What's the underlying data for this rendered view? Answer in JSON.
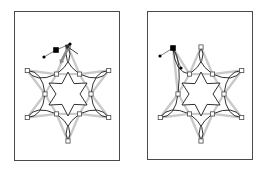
{
  "figure": {
    "type": "vector-editor-illustration",
    "background_color": "#ffffff",
    "panel_border_color": "#4a4a4a",
    "outline_color": "#1a1a1a",
    "skeleton_color": "#c9c9c9",
    "node_fill_color": "#ffffff",
    "node_stroke_color": "#4a4a4a",
    "selected_node_color": "#000000",
    "cursor_color": "#8a8a8a",
    "panels": [
      {
        "id": "before",
        "name": "left-panel",
        "geometry": {
          "x": 14,
          "y": 11,
          "width": 106,
          "height": 150
        },
        "shape": {
          "name": "six-petal-flower",
          "center": {
            "x": 53,
            "y": 82
          },
          "petal_count": 6,
          "inner_star_points": 6,
          "inner_star_outer_radius": 22,
          "inner_star_inner_radius": 12,
          "petal_inner_radius": 23,
          "petal_outer_radius": 47,
          "petal_half_width": 13,
          "rotation_deg": 90
        },
        "nodes": [
          {
            "name": "petal-tip-node",
            "angle_deg": 90,
            "radius": 47,
            "type": "square",
            "state": "normal"
          },
          {
            "name": "petal-tip-node",
            "angle_deg": 150,
            "radius": 47,
            "type": "square",
            "state": "normal"
          },
          {
            "name": "petal-tip-node",
            "angle_deg": 210,
            "radius": 47,
            "type": "square",
            "state": "normal"
          },
          {
            "name": "petal-tip-node",
            "angle_deg": 270,
            "radius": 47,
            "type": "square",
            "state": "normal"
          },
          {
            "name": "petal-tip-node",
            "angle_deg": 330,
            "radius": 47,
            "type": "square",
            "state": "normal"
          },
          {
            "name": "petal-tip-node",
            "angle_deg": 30,
            "radius": 47,
            "type": "square",
            "state": "normal"
          },
          {
            "name": "petal-base-node",
            "angle_deg": 60,
            "radius": 23,
            "type": "square",
            "state": "normal"
          },
          {
            "name": "petal-base-node",
            "angle_deg": 120,
            "radius": 23,
            "type": "square",
            "state": "normal"
          },
          {
            "name": "petal-base-node",
            "angle_deg": 180,
            "radius": 23,
            "type": "square",
            "state": "normal"
          },
          {
            "name": "petal-base-node",
            "angle_deg": 240,
            "radius": 23,
            "type": "square",
            "state": "normal"
          },
          {
            "name": "petal-base-node",
            "angle_deg": 300,
            "radius": 23,
            "type": "square",
            "state": "normal"
          },
          {
            "name": "petal-base-node",
            "angle_deg": 0,
            "radius": 23,
            "type": "square",
            "state": "normal"
          }
        ],
        "selection": {
          "selected_handle": {
            "name": "selected-control-point",
            "x": 41,
            "y": 38,
            "type": "filled-square"
          },
          "dots": [
            {
              "name": "control-dot",
              "x": 29,
              "y": 45
            },
            {
              "name": "control-dot",
              "x": 55,
              "y": 32
            }
          ],
          "drag_arrows": [
            {
              "name": "drag-arrow-down",
              "from": {
                "x": 55,
                "y": 32
              },
              "to": {
                "x": 45,
                "y": 52
              }
            },
            {
              "name": "drag-arrow-diagonal",
              "from": {
                "x": 63,
                "y": 42
              },
              "to": {
                "x": 50,
                "y": 33
              }
            }
          ]
        }
      },
      {
        "id": "after",
        "name": "right-panel",
        "geometry": {
          "x": 147,
          "y": 11,
          "width": 106,
          "height": 149
        },
        "shape": {
          "name": "six-petal-flower-edited",
          "center": {
            "x": 53,
            "y": 82
          },
          "petal_count": 6,
          "inner_star_points": 6,
          "inner_star_outer_radius": 22,
          "inner_star_inner_radius": 12,
          "petal_inner_radius": 23,
          "petal_outer_radius": 47,
          "petal_half_width": 13,
          "rotation_deg": 90,
          "edited_petal_angle_deg": 150,
          "edited_petal_tip": {
            "x": 25,
            "y": 36
          }
        },
        "nodes": [
          {
            "name": "petal-tip-node",
            "angle_deg": 90,
            "radius": 47,
            "type": "square",
            "state": "normal"
          },
          {
            "name": "petal-tip-node",
            "angle_deg": 210,
            "radius": 47,
            "type": "square",
            "state": "normal"
          },
          {
            "name": "petal-tip-node",
            "angle_deg": 270,
            "radius": 47,
            "type": "square",
            "state": "normal"
          },
          {
            "name": "petal-tip-node",
            "angle_deg": 330,
            "radius": 47,
            "type": "square",
            "state": "normal"
          },
          {
            "name": "petal-tip-node",
            "angle_deg": 30,
            "radius": 47,
            "type": "square",
            "state": "normal"
          },
          {
            "name": "petal-base-node",
            "angle_deg": 60,
            "radius": 23,
            "type": "square",
            "state": "normal"
          },
          {
            "name": "petal-base-node",
            "angle_deg": 120,
            "radius": 23,
            "type": "square",
            "state": "normal"
          },
          {
            "name": "petal-base-node",
            "angle_deg": 180,
            "radius": 23,
            "type": "square",
            "state": "normal"
          },
          {
            "name": "petal-base-node",
            "angle_deg": 240,
            "radius": 23,
            "type": "square",
            "state": "normal"
          },
          {
            "name": "petal-base-node",
            "angle_deg": 300,
            "radius": 23,
            "type": "square",
            "state": "normal"
          },
          {
            "name": "petal-base-node",
            "angle_deg": 0,
            "radius": 23,
            "type": "square",
            "state": "normal"
          }
        ],
        "selection": {
          "selected_handle": {
            "name": "selected-control-point",
            "x": 25,
            "y": 36,
            "type": "filled-square"
          },
          "dots": [
            {
              "name": "control-dot",
              "x": 12,
              "y": 44
            },
            {
              "name": "control-dot",
              "x": 33,
              "y": 56
            }
          ],
          "drag_arrows": []
        }
      }
    ]
  }
}
